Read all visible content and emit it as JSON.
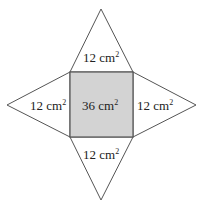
{
  "diagram": {
    "type": "square-pyramid-net",
    "colors": {
      "base_fill": "#d3d3d3",
      "face_fill": "#ffffff",
      "stroke": "#555555",
      "text": "#222222"
    },
    "base": {
      "label_value": "36 cm",
      "label_exp": "2"
    },
    "faces": {
      "top": {
        "label_value": "12 cm",
        "label_exp": "2"
      },
      "left": {
        "label_value": "12 cm",
        "label_exp": "2"
      },
      "right": {
        "label_value": "12 cm",
        "label_exp": "2"
      },
      "bottom": {
        "label_value": "12 cm",
        "label_exp": "2"
      }
    }
  }
}
